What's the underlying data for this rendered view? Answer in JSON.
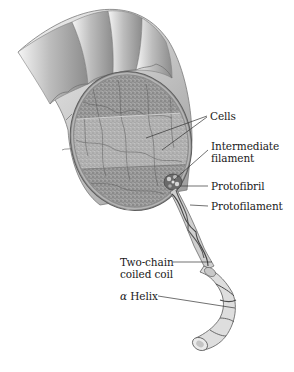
{
  "diagram": {
    "labels": {
      "cells": "Cells",
      "intermediate_filament_line1": "Intermediate",
      "intermediate_filament_line2": "filament",
      "protofibril": "Protofibril",
      "protofilament": "Protofilament",
      "coiled_coil_line1": "Two-chain",
      "coiled_coil_line2": "coiled coil",
      "helix_symbol": "α",
      "helix_text": "Helix"
    },
    "colors": {
      "background": "#ffffff",
      "label_text": "#1a1a1a",
      "leader_line": "#333333",
      "cuticle_light": "#e6e6e6",
      "cuticle_dark": "#8a8a8a",
      "cortex": "#9a9a9a",
      "cortex_band": "#b4b4b4",
      "rim": "#6e6e6e"
    }
  }
}
